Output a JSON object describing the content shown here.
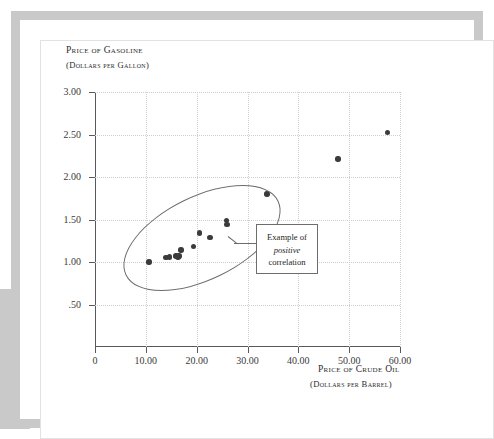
{
  "figure": {
    "y_axis_title_line1": "Price of Gasoline",
    "y_axis_title_line2": "(Dollars per Gallon)",
    "x_axis_title_line1": "Price of Crude Oil",
    "x_axis_title_line2": "(Dollars per Barrel)",
    "annotation": {
      "line1": "Example of",
      "line2": "positive",
      "line3": "correlation"
    }
  },
  "chart_data": {
    "type": "scatter",
    "title": "",
    "xlabel": "Price of Crude Oil (Dollars per Barrel)",
    "ylabel": "Price of Gasoline (Dollars per Gallon)",
    "xlim": [
      0,
      60
    ],
    "ylim": [
      0,
      3.0
    ],
    "grid": true,
    "legend": null,
    "x_ticks": [
      0,
      10,
      20,
      30,
      40,
      50,
      60
    ],
    "x_tick_labels": [
      "0",
      "10.00",
      "20.00",
      "30.00",
      "40.00",
      "50.00",
      "60.00"
    ],
    "y_ticks": [
      0.5,
      1.0,
      1.5,
      2.0,
      2.5,
      3.0
    ],
    "y_tick_labels": [
      ".50",
      "1.00",
      "1.50",
      "2.00",
      "2.50",
      "3.00"
    ],
    "marker_color": "#3b3b3b",
    "points": [
      {
        "x": 10.6,
        "y": 1.0
      },
      {
        "x": 14.0,
        "y": 1.05
      },
      {
        "x": 14.6,
        "y": 1.06
      },
      {
        "x": 15.9,
        "y": 1.07
      },
      {
        "x": 16.3,
        "y": 1.06
      },
      {
        "x": 16.5,
        "y": 1.07
      },
      {
        "x": 16.9,
        "y": 1.14
      },
      {
        "x": 19.4,
        "y": 1.18
      },
      {
        "x": 20.6,
        "y": 1.34
      },
      {
        "x": 22.6,
        "y": 1.29
      },
      {
        "x": 25.9,
        "y": 1.49
      },
      {
        "x": 26.0,
        "y": 1.44
      },
      {
        "x": 33.8,
        "y": 1.8
      },
      {
        "x": 47.8,
        "y": 2.21
      },
      {
        "x": 57.5,
        "y": 2.52
      }
    ],
    "annotations": [
      {
        "text": "Example of positive correlation",
        "shape": "ellipse",
        "ellipse_center": [
          19.5,
          1.22
        ],
        "note": "hand-drawn ellipse encircling the lower-left cluster, leader line to boxed label"
      }
    ]
  }
}
